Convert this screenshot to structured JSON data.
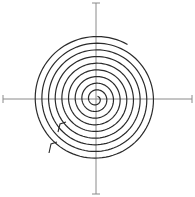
{
  "canvas": {
    "width": 195,
    "height": 197,
    "background": "#ffffff"
  },
  "colors": {
    "spiral": "#2a2a2a",
    "axis": "#8a8a8a"
  },
  "axes": {
    "center": [
      96,
      99
    ],
    "horizontal": {
      "x1": 3,
      "x2": 192,
      "y": 99,
      "cap": 4
    },
    "vertical": {
      "y1": 3,
      "y2": 194,
      "x": 96,
      "cap": 4
    }
  },
  "spiral": {
    "center": [
      96,
      99
    ],
    "start_radius": 3,
    "end_radius": 63,
    "turns": 9,
    "start_angle_deg": -60,
    "stroke_width": 1.2
  },
  "hooks": [
    {
      "points": [
        [
          58,
          132
        ],
        [
          60,
          124
        ],
        [
          66,
          122
        ]
      ]
    },
    {
      "points": [
        [
          49,
          153
        ],
        [
          51,
          144
        ],
        [
          57,
          142
        ]
      ]
    }
  ]
}
